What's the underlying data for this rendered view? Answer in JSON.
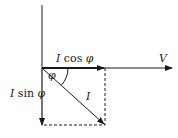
{
  "diagram": {
    "type": "phasor-diagram",
    "labels": {
      "voltage": "V",
      "current": "I",
      "angle": "φ",
      "active_component": "I cos φ",
      "reactive_component": "I sin φ"
    },
    "colors": {
      "line": "#1a1a1a",
      "background": "#ffffff"
    }
  }
}
